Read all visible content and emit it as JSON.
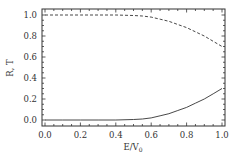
{
  "chart_data": {
    "type": "line",
    "title": "",
    "xlabel": "E/V0",
    "xlabel_main": "E/V",
    "xlabel_sub": "0",
    "ylabel": "R, T",
    "xlim": [
      0.0,
      1.0
    ],
    "ylim": [
      0.0,
      1.0
    ],
    "grid": false,
    "legend": "none",
    "x_ticks": [
      "0.0",
      "0.2",
      "0.4",
      "0.6",
      "0.8",
      "1.0"
    ],
    "y_ticks": [
      "0.0",
      "0.2",
      "0.4",
      "0.6",
      "0.8",
      "1.0"
    ],
    "x": [
      0.0,
      0.1,
      0.2,
      0.3,
      0.4,
      0.5,
      0.55,
      0.6,
      0.65,
      0.7,
      0.75,
      0.8,
      0.85,
      0.9,
      0.95,
      1.0
    ],
    "series": [
      {
        "name": "R",
        "style": "dashed",
        "values": [
          1.0,
          1.0,
          1.0,
          1.0,
          1.0,
          0.995,
          0.99,
          0.98,
          0.96,
          0.94,
          0.91,
          0.88,
          0.84,
          0.8,
          0.75,
          0.7
        ]
      },
      {
        "name": "T",
        "style": "solid",
        "values": [
          0.0,
          0.0,
          0.0,
          0.0,
          0.0,
          0.005,
          0.01,
          0.02,
          0.04,
          0.06,
          0.09,
          0.12,
          0.16,
          0.2,
          0.25,
          0.3
        ]
      }
    ]
  },
  "colors": {
    "line": "#333333",
    "axis": "#333333",
    "background": "#ffffff"
  }
}
